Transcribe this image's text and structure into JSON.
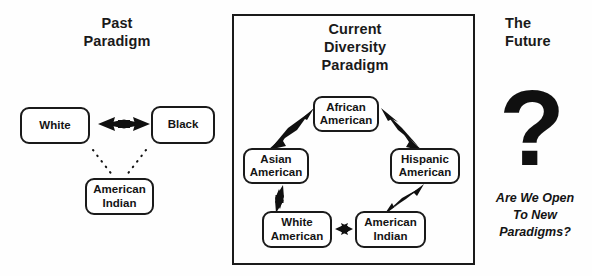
{
  "diagram": {
    "panels": {
      "past": {
        "heading": "Past\nParadigm",
        "nodes": {
          "white": "White",
          "black": "Black",
          "american_indian": "American\nIndian"
        },
        "connections": [
          {
            "from": "White",
            "to": "Black",
            "style": "solid",
            "arrowheads": "double"
          },
          {
            "from": "White",
            "to": "American Indian",
            "style": "dotted",
            "arrowheads": "none"
          },
          {
            "from": "Black",
            "to": "American Indian",
            "style": "dotted",
            "arrowheads": "none"
          }
        ]
      },
      "current": {
        "heading": "Current\nDiversity\nParadigm",
        "bordered": true,
        "nodes": {
          "african_american": "African\nAmerican",
          "asian_american": "Asian\nAmerican",
          "hispanic_american": "Hispanic\nAmerican",
          "white_american": "White\nAmerican",
          "american_indian": "American\nIndian"
        },
        "connections": [
          {
            "from": "Asian American",
            "to": "African American",
            "style": "solid",
            "arrowheads": "double"
          },
          {
            "from": "African American",
            "to": "Hispanic American",
            "style": "solid",
            "arrowheads": "double"
          },
          {
            "from": "Hispanic American",
            "to": "American Indian",
            "style": "solid",
            "arrowheads": "double"
          },
          {
            "from": "American Indian",
            "to": "White American",
            "style": "solid",
            "arrowheads": "double"
          },
          {
            "from": "White American",
            "to": "Asian American",
            "style": "solid",
            "arrowheads": "double"
          }
        ]
      },
      "future": {
        "heading": "The\nFuture",
        "symbol": "?",
        "question": "Are We Open\nTo New\nParadigms?"
      }
    },
    "colors": {
      "ink": "#1a1a1a",
      "background": "#fefefe",
      "node_fill": "#ffffff"
    }
  }
}
